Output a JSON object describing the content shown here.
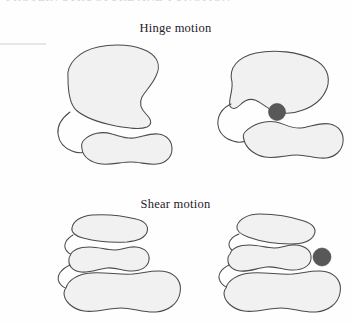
{
  "figure": {
    "background_color": "#fefefe",
    "width": 351,
    "height": 323,
    "clipped_header_text": "PROTEIN STRUCTURE AND FUNCTION",
    "outline_color": "#4c4a4b",
    "blob_fill_color": "#f1f1f1",
    "ligand_color": "#585858"
  },
  "panels": [
    {
      "id": "hinge",
      "title": "Hinge motion",
      "states": [
        {
          "id": "hinge-open",
          "label": "open",
          "has_ligand": false,
          "domain_count": 2
        },
        {
          "id": "hinge-closed",
          "label": "closed",
          "has_ligand": true,
          "domain_count": 2
        }
      ]
    },
    {
      "id": "shear",
      "title": "Shear motion",
      "states": [
        {
          "id": "shear-open",
          "label": "open",
          "has_ligand": false,
          "domain_count": 3
        },
        {
          "id": "shear-closed",
          "label": "closed",
          "has_ligand": true,
          "domain_count": 3
        }
      ]
    }
  ]
}
